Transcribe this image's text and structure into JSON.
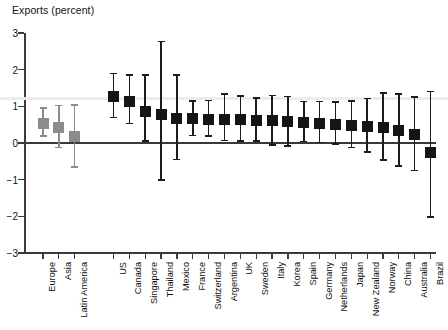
{
  "chart_data": {
    "type": "scatter",
    "title": "Exports (percent)",
    "xlabel": "",
    "ylabel": "Exports (percent)",
    "ylim": [
      -3,
      3
    ],
    "yticks": [
      3,
      2,
      1,
      0,
      -1,
      -2,
      -3
    ],
    "ytick_labels": [
      "3",
      "2",
      "1",
      "0",
      "−1",
      "−2",
      "−3"
    ],
    "grid": true,
    "gridlines": [
      1.2
    ],
    "legend": "none",
    "marker_style": "square with vertical 95% confidence interval whiskers",
    "group_gap_after_index": 2,
    "categories": [
      "Europe",
      "Asia",
      "Latin America",
      "US",
      "Canada",
      "Singapore",
      "Thailand",
      "Mexico",
      "France",
      "Switzerland",
      "Argentina",
      "UK",
      "Sweden",
      "Italy",
      "Korea",
      "Spain",
      "Germany",
      "Netherlands",
      "Japan",
      "New Zealand",
      "Norway",
      "China",
      "Australia",
      "Brazil"
    ],
    "values": [
      0.53,
      0.42,
      0.18,
      1.26,
      1.12,
      0.86,
      0.77,
      0.68,
      0.66,
      0.65,
      0.64,
      0.63,
      0.61,
      0.6,
      0.58,
      0.56,
      0.53,
      0.5,
      0.47,
      0.45,
      0.42,
      0.35,
      0.22,
      -0.26
    ],
    "ci_low": [
      0.19,
      -0.12,
      -0.65,
      0.7,
      0.53,
      0.06,
      -1.0,
      -0.45,
      0.21,
      0.19,
      0.07,
      0.06,
      0.05,
      -0.05,
      -0.08,
      0.04,
      0.02,
      -0.02,
      -0.12,
      -0.25,
      -0.46,
      -0.63,
      -0.75,
      -2.02
    ],
    "ci_high": [
      0.96,
      1.02,
      1.03,
      1.9,
      1.85,
      1.86,
      2.77,
      1.85,
      1.15,
      1.16,
      1.34,
      1.28,
      1.23,
      1.3,
      1.27,
      1.13,
      1.13,
      1.12,
      1.14,
      1.21,
      1.37,
      1.34,
      1.25,
      1.4
    ],
    "series_colors": {
      "region_aggregate": "#8c8c8c",
      "country": "#151515"
    },
    "point_colors": [
      "region_aggregate",
      "region_aggregate",
      "region_aggregate",
      "country",
      "country",
      "country",
      "country",
      "country",
      "country",
      "country",
      "country",
      "country",
      "country",
      "country",
      "country",
      "country",
      "country",
      "country",
      "country",
      "country",
      "country",
      "country",
      "country",
      "country"
    ]
  }
}
